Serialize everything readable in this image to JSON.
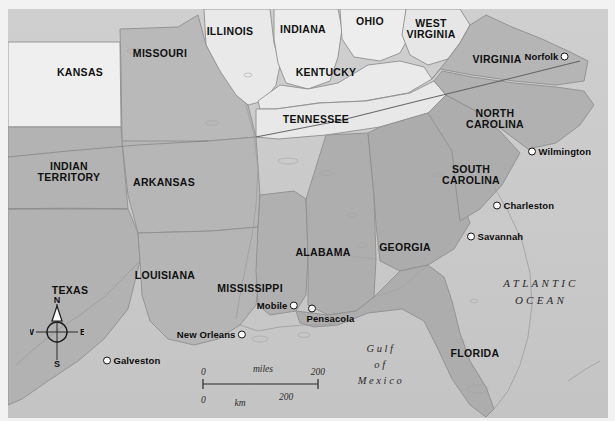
{
  "map": {
    "title": "Map of the Southeastern United States (Civil War era)",
    "colors": {
      "union_state": "#ededed",
      "confederate_state": "#b4b4b4",
      "border_state": "#dcdcdc",
      "water": "#c9c9c9",
      "outline": "#8c8c8c",
      "text": "#101010",
      "city_dot_fill": "#ffffff",
      "city_dot_stroke": "#141414",
      "background": "#f2f2f2"
    },
    "states": [
      {
        "name": "KANSAS",
        "x": 72,
        "y": 63,
        "shade": "light"
      },
      {
        "name": "MISSOURI",
        "x": 152,
        "y": 44,
        "shade": "mid"
      },
      {
        "name": "ILLINOIS",
        "x": 222,
        "y": 22,
        "shade": "light"
      },
      {
        "name": "INDIANA",
        "x": 295,
        "y": 20,
        "shade": "light"
      },
      {
        "name": "OHIO",
        "x": 362,
        "y": 12,
        "shade": "light"
      },
      {
        "name": "WEST\nVIRGINIA",
        "x": 423,
        "y": 20,
        "shade": "light"
      },
      {
        "name": "VIRGINIA",
        "x": 489,
        "y": 50,
        "shade": "mid"
      },
      {
        "name": "KENTUCKY",
        "x": 318,
        "y": 63,
        "shade": "light"
      },
      {
        "name": "NORTH\nCAROLINA",
        "x": 487,
        "y": 110,
        "shade": "mid"
      },
      {
        "name": "TENNESSEE",
        "x": 308,
        "y": 110,
        "shade": "light"
      },
      {
        "name": "SOUTH\nCAROLINA",
        "x": 463,
        "y": 166,
        "shade": "mid"
      },
      {
        "name": "INDIAN\nTERRITORY",
        "x": 61,
        "y": 163,
        "shade": "mid"
      },
      {
        "name": "ARKANSAS",
        "x": 156,
        "y": 173,
        "shade": "mid"
      },
      {
        "name": "GEORGIA",
        "x": 397,
        "y": 238,
        "shade": "mid"
      },
      {
        "name": "ALABAMA",
        "x": 315,
        "y": 243,
        "shade": "mid"
      },
      {
        "name": "MISSISSIPPI",
        "x": 242,
        "y": 279,
        "shade": "mid"
      },
      {
        "name": "LOUISIANA",
        "x": 157,
        "y": 266,
        "shade": "mid"
      },
      {
        "name": "TEXAS",
        "x": 62,
        "y": 281,
        "shade": "mid"
      },
      {
        "name": "FLORIDA",
        "x": 467,
        "y": 344,
        "shade": "mid"
      }
    ],
    "cities": [
      {
        "name": "Norfolk",
        "x": 553,
        "y": 47,
        "label_side": "left"
      },
      {
        "name": "Wilmington",
        "x": 524,
        "y": 142,
        "label_side": "right"
      },
      {
        "name": "Charleston",
        "x": 489,
        "y": 196,
        "label_side": "right"
      },
      {
        "name": "Savannah",
        "x": 463,
        "y": 227,
        "label_side": "right"
      },
      {
        "name": "Pensacola",
        "x": 309,
        "y": 303,
        "label_side": "right"
      },
      {
        "name": "Mobile",
        "x": 289,
        "y": 296,
        "label_side": "left"
      },
      {
        "name": "New Orleans",
        "x": 234,
        "y": 325,
        "label_side": "left"
      },
      {
        "name": "Galveston",
        "x": 107,
        "y": 359,
        "label_side": "right"
      }
    ],
    "water_labels": [
      {
        "name": "ATLANTIC\nOCEAN",
        "x": 533,
        "y": 282,
        "style": "ocean"
      },
      {
        "name": "Gulf\nof\nMexico",
        "x": 373,
        "y": 356,
        "style": "gulf"
      }
    ],
    "compass": {
      "north": "N",
      "south": "S",
      "east": "E",
      "west": "W"
    },
    "scale": {
      "miles_label": "miles",
      "km_label": "km",
      "miles_start": "0",
      "miles_end": "200",
      "km_start": "0",
      "km_end": "200"
    }
  }
}
